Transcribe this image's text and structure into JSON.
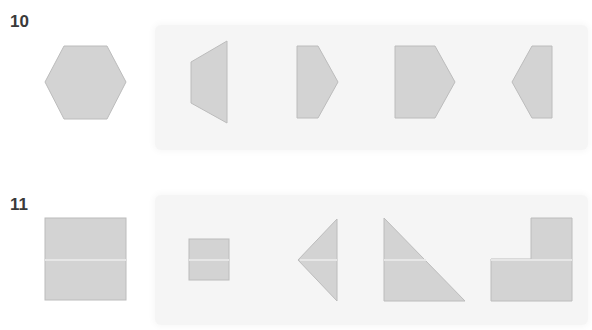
{
  "problems": [
    {
      "number": "10",
      "target_shape": "hexagon",
      "options": [
        "trapezoid",
        "pentagon-right-small",
        "pentagon-right-large",
        "pentagon-left-small"
      ]
    },
    {
      "number": "11",
      "target_shape": "square",
      "options": [
        "small-square",
        "triangle-left",
        "right-triangle",
        "l-shape"
      ]
    }
  ],
  "colors": {
    "shape_fill": "#d3d3d3",
    "shape_stroke": "#bcbcbc",
    "panel_bg": "#f5f5f5",
    "label": "#3a3a3a"
  }
}
